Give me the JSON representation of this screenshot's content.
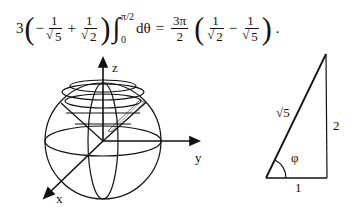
{
  "equation": {
    "coefficient_left": "3",
    "term1_sign": "−",
    "term1_num": "1",
    "term1_den_rad": "5",
    "plus": "+",
    "term2_num": "1",
    "term2_den_rad": "2",
    "integral_upper": "π/2",
    "integral_lower": "0",
    "differential": "dθ",
    "equals": "=",
    "rhs_coef_num": "3π",
    "rhs_coef_den": "2",
    "rhs_term1_num": "1",
    "rhs_term1_den_rad": "2",
    "minus": "−",
    "rhs_term2_num": "1",
    "rhs_term2_den_rad": "5",
    "period": "."
  },
  "sphere_figure": {
    "axis_labels": {
      "z": "z",
      "y": "y",
      "x": "x"
    },
    "description": "Sphere with inscribed cone about z-axis"
  },
  "triangle_figure": {
    "hypotenuse_label": "√5",
    "vertical_side_label": "2",
    "base_label": "1",
    "angle_label": "φ"
  }
}
